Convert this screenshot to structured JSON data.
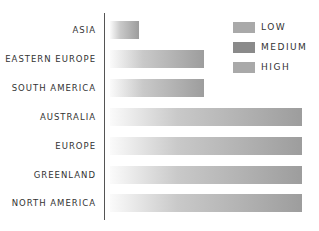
{
  "chart_data": {
    "type": "bar",
    "orientation": "horizontal",
    "title": "",
    "xlabel": "",
    "ylabel": "",
    "categories": [
      "ASIA",
      "EASTERN EUROPE",
      "SOUTH AMERICA",
      "AUSTRALIA",
      "EUROPE",
      "GREENLAND",
      "NORTH AMERICA"
    ],
    "values": [
      15,
      49,
      49,
      100,
      100,
      100,
      100
    ],
    "value_note": "relative bar lengths (no axis ticks shown)",
    "xlim": [
      0,
      100
    ],
    "grid": false,
    "legend": {
      "position": "top-right",
      "entries": [
        {
          "label": "LOW",
          "color": "#a9a9a9"
        },
        {
          "label": "MEDIUM",
          "color": "#8a8a8a"
        },
        {
          "label": "HIGH",
          "color": "#a9a9a9"
        }
      ]
    }
  }
}
